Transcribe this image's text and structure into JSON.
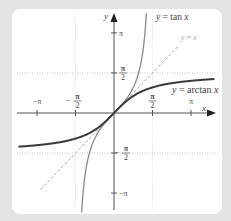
{
  "chart_data": {
    "type": "line",
    "title": "",
    "xlabel": "x",
    "ylabel": "y",
    "xlim": [
      -4.0,
      3.9
    ],
    "ylim": [
      -3.9,
      3.9
    ],
    "x_ticks": [
      {
        "value": -3.1416,
        "label": "−π"
      },
      {
        "value": -1.5708,
        "label": "−π/2"
      },
      {
        "value": 1.5708,
        "label": "π/2"
      },
      {
        "value": 3.1416,
        "label": "π"
      }
    ],
    "y_ticks": [
      {
        "value": 3.1416,
        "label": "π"
      },
      {
        "value": 1.5708,
        "label": "π/2"
      },
      {
        "value": -1.5708,
        "label": "−π/2"
      },
      {
        "value": -3.1416,
        "label": "−π"
      }
    ],
    "grid": "dotted reference lines at x = ±π/2 and y = ±π/2",
    "series": [
      {
        "name": "y = tan x",
        "domain": [
          -1.5708,
          1.5708
        ],
        "style": "solid, medium gray",
        "asymptotes": [
          -1.5708,
          1.5708
        ]
      },
      {
        "name": "y = x",
        "domain": [
          -3.0,
          3.0
        ],
        "style": "dashed, light gray"
      },
      {
        "name": "y = arctan x",
        "domain": [
          -3.9,
          3.9
        ],
        "style": "solid thick, dark gray",
        "horizontal_asymptotes": [
          -1.5708,
          1.5708
        ]
      }
    ],
    "annotations": [
      "y = tan x",
      "y = x",
      "y = arctan x"
    ]
  },
  "labels": {
    "x_axis": "x",
    "y_axis": "y",
    "pi": "π",
    "neg_pi": "−π",
    "half_num": "π",
    "half_den": "2",
    "minus": "−",
    "tan_label_y": "y",
    "tan_label_eq": " = tan ",
    "tan_label_x": "x",
    "id_label_y": "y",
    "id_label_eq": " = ",
    "id_label_x": "x",
    "atan_label_y": "y",
    "atan_label_eq": " = arctan ",
    "atan_label_x": "x"
  },
  "colors": {
    "background": "#e4e4e4",
    "panel": "#ffffff",
    "axes": "#555555",
    "arctan": "#3a3a3a",
    "tan": "#8a8a8a",
    "identity": "#a8a8a8",
    "grid": "#b8b8b8"
  }
}
